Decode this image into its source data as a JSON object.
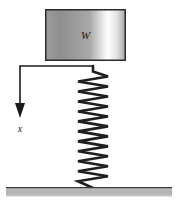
{
  "figure": {
    "canvas": {
      "width": 180,
      "height": 206,
      "background": "#ffffff"
    },
    "block": {
      "label": "W",
      "label_meaning": "weight",
      "x": 45,
      "y": 9,
      "width": 81,
      "height": 52,
      "border_color": "#2b2b2b",
      "border_width": 1.5,
      "gradient_stops": [
        "#9d9d9d",
        "#8e8e8e",
        "#a8a8a8",
        "#ffffff",
        "#e2e2e2",
        "#a5a5a5"
      ]
    },
    "spring": {
      "top_x": 93,
      "top_y": 66,
      "bottom_x": 93,
      "bottom_y": 188,
      "coil_count": 11,
      "amplitude": 15,
      "stroke_color": "#1f1f1f",
      "stroke_width": 2.6
    },
    "arrow": {
      "label": "x",
      "label_meaning": "displacement",
      "horizontal_start_x": 19,
      "horizontal_end_x": 93,
      "horizontal_y": 66,
      "vertical_x": 20,
      "vertical_end_y": 118,
      "head_half_width": 5,
      "head_height": 15,
      "stroke_color": "#1a1a1a",
      "stroke_width": 1.6,
      "label_x": 20,
      "label_y": 132
    },
    "ground": {
      "x": 6,
      "y": 187,
      "width": 166,
      "height": 9,
      "fill_color": "#b4b4b4",
      "edge_color": "#3a3a3a"
    }
  }
}
